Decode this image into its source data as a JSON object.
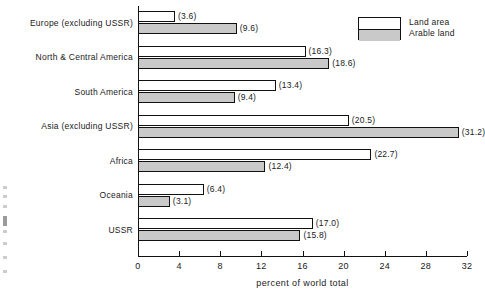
{
  "chart_data": {
    "type": "bar",
    "orientation": "horizontal",
    "title": "",
    "subtitle": "",
    "xlabel": "percent of world total",
    "ylabel": "",
    "xlim": [
      0,
      32
    ],
    "xticks": [
      0,
      4,
      8,
      12,
      16,
      20,
      24,
      28,
      32
    ],
    "xtick_labels": [
      "0",
      "4",
      "8",
      "12",
      "16",
      "20",
      "24",
      "28",
      "32"
    ],
    "grid": false,
    "legend_position": "top-right",
    "categories": [
      "Europe (excluding USSR)",
      "North & Central America",
      "South America",
      "Asia (excluding USSR)",
      "Africa",
      "Oceania",
      "USSR"
    ],
    "series": [
      {
        "name": "Land area",
        "color": "#ffffff",
        "values": [
          3.6,
          16.3,
          13.4,
          20.5,
          22.7,
          6.4,
          17.0
        ],
        "labels": [
          "(3.6)",
          "(16.3)",
          "(13.4)",
          "(20.5)",
          "(22.7)",
          "(6.4)",
          "(17.0)"
        ]
      },
      {
        "name": "Arable land",
        "color": "#c9c9c9",
        "values": [
          9.6,
          18.6,
          9.4,
          31.2,
          12.4,
          3.1,
          15.8
        ],
        "labels": [
          "(9.6)",
          "(18.6)",
          "(9.4)",
          "(31.2)",
          "(12.4)",
          "(3.1)",
          "(15.8)"
        ]
      }
    ]
  },
  "legend": {
    "items": [
      {
        "label": "Land area"
      },
      {
        "label": "Arable land"
      }
    ]
  },
  "axis": {
    "x_title": "percent of world total"
  },
  "colors": {
    "land_area": "#ffffff",
    "arable_land": "#c9c9c9",
    "ink": "#111111",
    "background": "#ffffff"
  }
}
